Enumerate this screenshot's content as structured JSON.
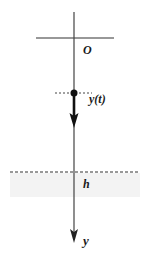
{
  "diagram": {
    "labels": {
      "origin": "O",
      "position": "y(t)",
      "height": "h",
      "axis": "y"
    },
    "colors": {
      "line": "#333333",
      "shade": "#f2f2f2",
      "text": "#1a1a1a"
    }
  }
}
